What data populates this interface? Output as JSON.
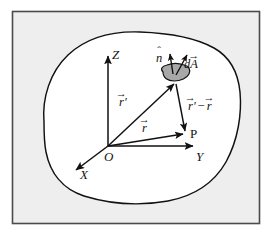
{
  "figure": {
    "type": "vector-field-surface-diagram",
    "caption_absent": true,
    "frame": {
      "border_color": "#4a4a4a",
      "outer_background": "#ffffff",
      "inner_background": "#eeeeee"
    },
    "region": {
      "name": "closed-volume-boundary",
      "fill": "#ffffff",
      "stroke": "#111111"
    },
    "surface_element": {
      "name": "area-patch",
      "fill": "#a8a8a8",
      "stroke": "#111111"
    }
  },
  "axes": {
    "origin_label": "O",
    "z_label": "Z",
    "y_label": "Y",
    "x_label": "X",
    "color": "#111111"
  },
  "points": {
    "field_point_label": "P"
  },
  "vectors": [
    {
      "id": "r-prime",
      "letter": "r",
      "accent": "→",
      "prime": "′",
      "description": "source-position-vector-to-patch"
    },
    {
      "id": "r",
      "letter": "r",
      "accent": "→",
      "prime": "",
      "description": "field-position-vector-to-P"
    },
    {
      "id": "separation",
      "letter": "r",
      "accent": "→",
      "prime": "′",
      "operator": "−",
      "letter2": "r",
      "accent2": "→",
      "description": "separation-vector-patch-to-P"
    },
    {
      "id": "normal",
      "letter": "n",
      "accent": "ˆ",
      "description": "unit-normal-vector"
    },
    {
      "id": "dA",
      "prefix": "d",
      "letter": "A",
      "accent": "→",
      "description": "differential-area-vector"
    }
  ]
}
